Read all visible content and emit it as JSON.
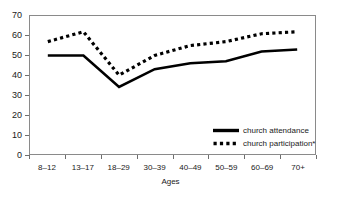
{
  "chart_data": {
    "type": "line",
    "title": "",
    "xlabel": "Ages",
    "ylabel": "",
    "categories": [
      "8–12",
      "13–17",
      "18–29",
      "30–39",
      "40–49",
      "50–59",
      "60–69",
      "70+"
    ],
    "ylim": [
      0,
      70
    ],
    "y_ticks": [
      0,
      10,
      20,
      30,
      40,
      50,
      60,
      70
    ],
    "grid": false,
    "legend_position": "inside bottom-right",
    "series": [
      {
        "name": "church attendance",
        "style": "solid",
        "color": "#000000",
        "values": [
          50,
          50,
          34,
          43,
          46,
          47,
          52,
          53
        ]
      },
      {
        "name": "church participation*",
        "style": "dotted",
        "color": "#000000",
        "values": [
          57,
          62,
          40,
          50,
          55,
          57,
          61,
          62
        ]
      }
    ]
  },
  "axes": {
    "x_title": "Ages"
  },
  "legend": {
    "entries": [
      {
        "label": "church attendance",
        "key": "solid-line-key"
      },
      {
        "label": "church participation*",
        "key": "dotted-line-key"
      }
    ]
  }
}
